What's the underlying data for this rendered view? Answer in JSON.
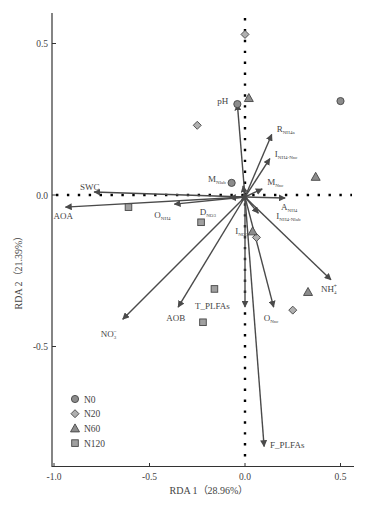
{
  "chart_data": {
    "type": "scatter",
    "subtype": "rda-biplot",
    "title": "",
    "xlabel": "RDA 1（28.96%）",
    "ylabel": "RDA 2（21.39%）",
    "xlim": [
      -1.02,
      0.56
    ],
    "ylim": [
      -0.9,
      0.6
    ],
    "xticks": [
      -1.0,
      -0.5,
      0.0,
      0.5
    ],
    "xtick_labels": [
      "-1.0",
      "-0.5",
      "0.0",
      "0.5"
    ],
    "yticks": [
      0.5,
      0.0,
      -0.5
    ],
    "ytick_labels": [
      "0.5",
      "0.0",
      "-0.5"
    ],
    "grid": false,
    "zero_lines": "dotted",
    "legend_position": "lower-left",
    "legend": [
      {
        "name": "N0",
        "marker": "circle"
      },
      {
        "name": "N20",
        "marker": "diamond"
      },
      {
        "name": "N60",
        "marker": "triangle"
      },
      {
        "name": "N120",
        "marker": "square"
      }
    ],
    "series": [
      {
        "name": "N0",
        "marker": "circle",
        "points": [
          [
            -0.04,
            0.3
          ],
          [
            0.5,
            0.31
          ],
          [
            -0.07,
            0.04
          ]
        ]
      },
      {
        "name": "N20",
        "marker": "diamond",
        "points": [
          [
            0.0,
            0.53
          ],
          [
            -0.25,
            0.23
          ],
          [
            0.06,
            -0.14
          ],
          [
            0.25,
            -0.38
          ]
        ]
      },
      {
        "name": "N60",
        "marker": "triangle",
        "points": [
          [
            0.02,
            0.32
          ],
          [
            0.37,
            0.06
          ],
          [
            0.04,
            -0.12
          ],
          [
            0.33,
            -0.32
          ]
        ]
      },
      {
        "name": "N120",
        "marker": "square",
        "points": [
          [
            -0.61,
            -0.04
          ],
          [
            -0.23,
            -0.09
          ],
          [
            -0.16,
            -0.31
          ],
          [
            -0.22,
            -0.42
          ]
        ]
      }
    ],
    "vectors": [
      {
        "name": "pH",
        "label": "pH",
        "sub": "",
        "sup": "",
        "x": -0.04,
        "y": 0.3
      },
      {
        "name": "R_NH4a",
        "label": "R",
        "sub": "NH4a",
        "sup": "",
        "x": 0.14,
        "y": 0.2
      },
      {
        "name": "I_NH4-Nnc",
        "label": "I",
        "sub": "NH4-Nnc",
        "sup": "",
        "x": 0.13,
        "y": 0.12
      },
      {
        "name": "M_Nlab",
        "label": "M",
        "sub": "Nlab",
        "sup": "",
        "x": -0.01,
        "y": 0.03
      },
      {
        "name": "M_Nnc",
        "label": "M",
        "sub": "Nnc",
        "sup": "",
        "x": 0.09,
        "y": 0.02
      },
      {
        "name": "A_NH4",
        "label": "A",
        "sub": "NH4",
        "sup": "",
        "x": 0.21,
        "y": -0.01
      },
      {
        "name": "I_NH4-Nlab",
        "label": "I",
        "sub": "NH4-Nlab",
        "sup": "",
        "x": 0.07,
        "y": -0.06
      },
      {
        "name": "SWC",
        "label": "SWC",
        "sub": "",
        "sup": "",
        "x": -0.79,
        "y": 0.01
      },
      {
        "name": "AOA",
        "label": "AOA",
        "sub": "",
        "sup": "",
        "x": -0.94,
        "y": -0.04
      },
      {
        "name": "O_NH4",
        "label": "O",
        "sub": "NH4",
        "sup": "",
        "x": -0.37,
        "y": -0.03
      },
      {
        "name": "D_NO3",
        "label": "D",
        "sub": "NO3",
        "sup": "",
        "x": -0.08,
        "y": -0.01
      },
      {
        "name": "I_NO3",
        "label": "I",
        "sub": "NO3",
        "sup": "",
        "x": -0.02,
        "y": -0.02
      },
      {
        "name": "NH4+",
        "label": "NH",
        "sub": "4",
        "sup": "+",
        "x": 0.45,
        "y": -0.28
      },
      {
        "name": "O_Nnc",
        "label": "O",
        "sub": "Nnc",
        "sup": "",
        "x": 0.15,
        "y": -0.37
      },
      {
        "name": "NO3-",
        "label": "NO",
        "sub": "3",
        "sup": "−",
        "x": -0.64,
        "y": -0.41
      },
      {
        "name": "AOB",
        "label": "AOB",
        "sub": "",
        "sup": "",
        "x": -0.35,
        "y": -0.37
      },
      {
        "name": "T_PLFAs",
        "label": "T_PLFAs",
        "sub": "",
        "sup": "",
        "x": 0.0,
        "y": -0.37
      },
      {
        "name": "F_PLFAs",
        "label": "F_PLFAs",
        "sub": "",
        "sup": "",
        "x": 0.1,
        "y": -0.83
      }
    ]
  },
  "axes": {
    "xlabel": "RDA 1（28.96%）",
    "ylabel": "RDA 2（21.39%）"
  },
  "colors": {
    "axis": "#333333",
    "arrow": "#4a4a4a",
    "marker_fill": "#8c8c8c",
    "marker_stroke": "#444444",
    "text": "#444444"
  }
}
